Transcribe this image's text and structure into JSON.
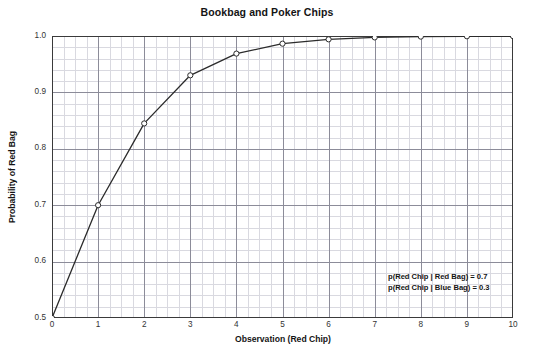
{
  "chart_data": {
    "type": "line",
    "title": "Bookbag and Poker Chips",
    "xlabel": "Observation (Red Chip)",
    "ylabel": "Probability of Red Bag",
    "xlim": [
      0,
      10
    ],
    "ylim": [
      0.5,
      1.0
    ],
    "xticks": [
      "0",
      "1",
      "2",
      "3",
      "4",
      "5",
      "6",
      "7",
      "8",
      "9",
      "10"
    ],
    "yticks": [
      "0.5",
      "0.6",
      "0.7",
      "0.8",
      "0.9",
      "1.0"
    ],
    "x_major_step": 1,
    "y_major_step": 0.1,
    "x_minor_per_major": 4,
    "y_minor_per_major": 5,
    "grid": true,
    "legend": "none",
    "marker": "open-circle",
    "line_color": "#2b2b2b",
    "grid_major_color": "#8c8c99",
    "grid_minor_color": "#d9d9e0",
    "series": [
      {
        "name": "Probability of Red Bag",
        "x": [
          0,
          1,
          2,
          3,
          4,
          5,
          6,
          7,
          8,
          9,
          10
        ],
        "values": [
          0.5,
          0.7,
          0.845,
          0.9303,
          0.9688,
          0.9864,
          0.9941,
          0.9975,
          0.9989,
          0.9995,
          0.9998
        ]
      }
    ],
    "annotations": [
      "p(Red Chip | Red Bag) = 0.7",
      "p(Red Chip | Blue Bag) = 0.3"
    ]
  }
}
